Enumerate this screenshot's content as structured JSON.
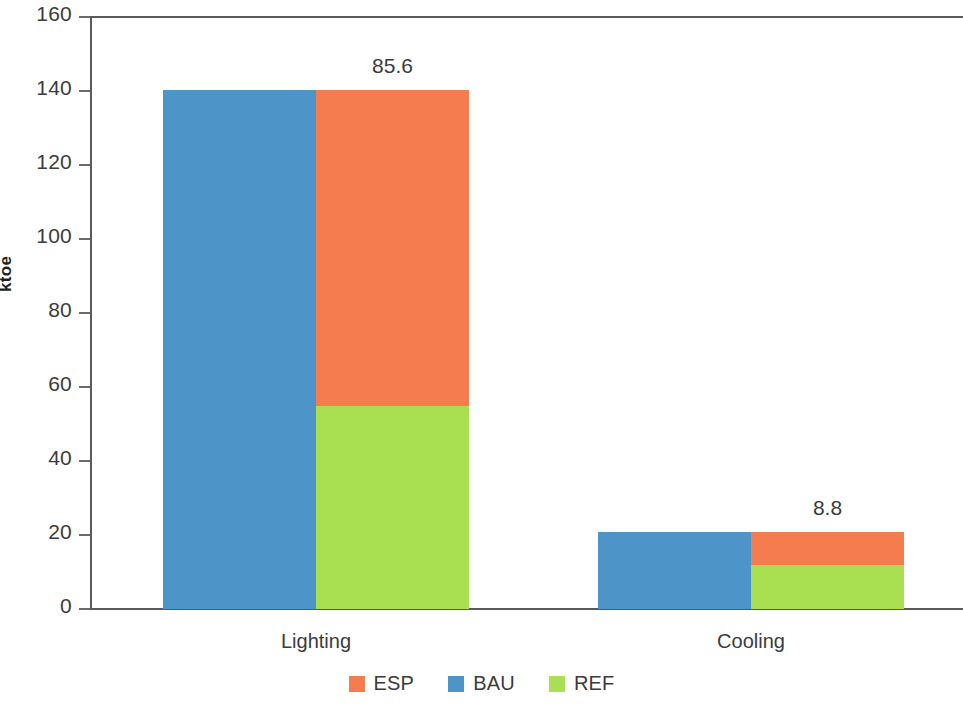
{
  "chart_data": {
    "type": "bar",
    "subtype": "stacked-grouped",
    "title": "",
    "xlabel": "",
    "ylabel": "ktoe",
    "ylim": [
      0,
      160
    ],
    "yticks": [
      0,
      20,
      40,
      60,
      80,
      100,
      120,
      140,
      160
    ],
    "ytick_labels": [
      "0",
      "20",
      "40",
      "60",
      "80",
      "100",
      "120",
      "140",
      "160"
    ],
    "grid": false,
    "legend_position": "bottom",
    "categories": [
      "Lighting",
      "Cooling"
    ],
    "series": [
      {
        "name": "ESP",
        "color": "#f57c4e",
        "values": [
          85.6,
          8.8
        ]
      },
      {
        "name": "BAU",
        "color": "#4d95c8",
        "values": [
          140.4,
          20.8
        ]
      },
      {
        "name": "REF",
        "color": "#a8e052",
        "values": [
          54.8,
          12.0
        ]
      }
    ],
    "groups": [
      {
        "category": "Lighting",
        "bars": [
          {
            "name": "BAU",
            "segments": [
              {
                "series": "BAU",
                "value": 140.4,
                "color": "#4d95c8"
              }
            ],
            "total": 140.4
          },
          {
            "name": "REF+ESP",
            "segments": [
              {
                "series": "REF",
                "value": 54.8,
                "color": "#a8e052"
              },
              {
                "series": "ESP",
                "value": 85.6,
                "color": "#f57c4e"
              }
            ],
            "total": 140.4
          }
        ],
        "annotation": "85.6"
      },
      {
        "category": "Cooling",
        "bars": [
          {
            "name": "BAU",
            "segments": [
              {
                "series": "BAU",
                "value": 20.8,
                "color": "#4d95c8"
              }
            ],
            "total": 20.8
          },
          {
            "name": "REF+ESP",
            "segments": [
              {
                "series": "REF",
                "value": 12.0,
                "color": "#a8e052"
              },
              {
                "series": "ESP",
                "value": 8.8,
                "color": "#f57c4e"
              }
            ],
            "total": 20.8
          }
        ],
        "annotation": "8.8"
      }
    ],
    "annotations": [
      {
        "text": "85.6",
        "category": "Lighting",
        "series": "ESP"
      },
      {
        "text": "8.8",
        "category": "Cooling",
        "series": "ESP"
      }
    ],
    "legend": [
      {
        "label": "ESP",
        "color": "#f57c4e"
      },
      {
        "label": "BAU",
        "color": "#4d95c8"
      },
      {
        "label": "REF",
        "color": "#a8e052"
      }
    ]
  },
  "axis": {
    "y_title": "ktoe",
    "tick_labels": [
      "160",
      "140",
      "120",
      "100",
      "80",
      "60",
      "40",
      "20",
      "0"
    ]
  },
  "colors": {
    "esp": "#f57c4e",
    "bau": "#4d95c8",
    "ref": "#a8e052",
    "axis": "#5a5a5a",
    "text": "#3b3b3b"
  }
}
